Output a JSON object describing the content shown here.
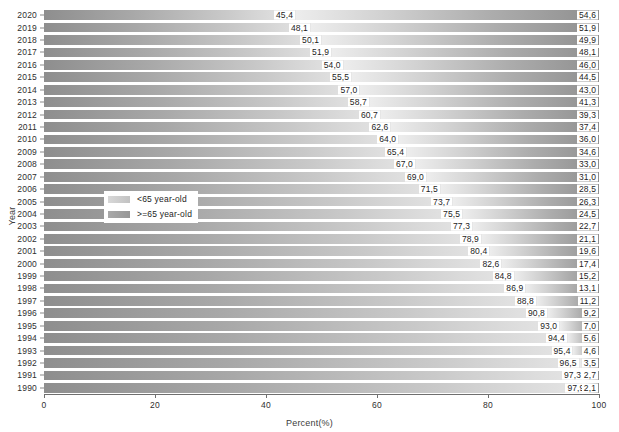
{
  "chart_data": {
    "type": "bar",
    "subtype": "stacked-horizontal-100percent",
    "title": "",
    "xlabel": "Percent(%)",
    "ylabel": "Year",
    "xlim": [
      0,
      100
    ],
    "xticks": [
      0,
      20,
      40,
      60,
      80,
      100
    ],
    "grid": false,
    "legend_position": "inside-left-middle",
    "categories": [
      "2020",
      "2019",
      "2018",
      "2017",
      "2016",
      "2015",
      "2014",
      "2013",
      "2012",
      "2011",
      "2010",
      "2009",
      "2008",
      "2007",
      "2006",
      "2005",
      "2004",
      "2003",
      "2002",
      "2001",
      "2000",
      "1999",
      "1998",
      "1997",
      "1996",
      "1995",
      "1994",
      "1993",
      "1992",
      "1991",
      "1990"
    ],
    "series": [
      {
        "name": "<65 year-old",
        "color": "#b4b4b4",
        "values": [
          45.4,
          48.1,
          50.1,
          51.9,
          54.0,
          55.5,
          57.0,
          58.7,
          60.7,
          62.6,
          64.0,
          65.4,
          67.0,
          69.0,
          71.5,
          73.7,
          75.5,
          77.3,
          78.9,
          80.4,
          82.6,
          84.8,
          86.9,
          88.8,
          90.8,
          93.0,
          94.4,
          95.4,
          96.5,
          97.3,
          97.9
        ]
      },
      {
        "name": ">=65 year-old",
        "color": "#949494",
        "values": [
          54.6,
          51.9,
          49.9,
          48.1,
          46.0,
          44.5,
          43.0,
          41.3,
          39.3,
          37.4,
          36.0,
          34.6,
          33.0,
          31.0,
          28.5,
          26.3,
          24.5,
          22.7,
          21.1,
          19.6,
          17.4,
          15.2,
          13.1,
          11.2,
          9.2,
          7.0,
          5.6,
          4.6,
          3.5,
          2.7,
          2.1
        ]
      }
    ],
    "value_label_format": "comma-decimal",
    "value_labels": {
      "low": [
        "45,4",
        "48,1",
        "50,1",
        "51,9",
        "54,0",
        "55,5",
        "57,0",
        "58,7",
        "60,7",
        "62,6",
        "64,0",
        "65,4",
        "67,0",
        "69,0",
        "71,5",
        "73,7",
        "75,5",
        "77,3",
        "78,9",
        "80,4",
        "82,6",
        "84,8",
        "86,9",
        "88,8",
        "90,8",
        "93,0",
        "94,4",
        "95,4",
        "96,5",
        "97,3",
        "97,9"
      ],
      "high": [
        "54,6",
        "51,9",
        "49,9",
        "48,1",
        "46,0",
        "44,5",
        "43,0",
        "41,3",
        "39,3",
        "37,4",
        "36,0",
        "34,6",
        "33,0",
        "31,0",
        "28,5",
        "26,3",
        "24,5",
        "22,7",
        "21,1",
        "19,6",
        "17,4",
        "15,2",
        "13,1",
        "11,2",
        "9,2",
        "7,0",
        "5,6",
        "4,6",
        "3,5",
        "2,7",
        "2,1"
      ]
    }
  },
  "legend": {
    "items": [
      {
        "label": "<65 year-old",
        "key": "low"
      },
      {
        "label": ">=65 year-old",
        "key": "high"
      }
    ]
  },
  "axis": {
    "x_title": "Percent(%)",
    "y_title": "Year",
    "x_tick_labels": [
      "0",
      "20",
      "40",
      "60",
      "80",
      "100"
    ]
  }
}
